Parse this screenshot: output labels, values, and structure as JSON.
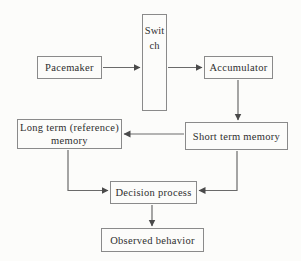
{
  "diagram": {
    "colors": {
      "background": "#fcfcfa",
      "box_border": "#8a8a8a",
      "arrow_line": "#6a6a6a",
      "text": "#2e2e2e"
    },
    "nodes": {
      "pacemaker": {
        "label": "Pacemaker"
      },
      "switch": {
        "label": "Switch",
        "orientation": "vertical-stacked-letters"
      },
      "accumulator": {
        "label": "Accumulator"
      },
      "long_term": {
        "label": "Long term (reference) memory"
      },
      "short_term": {
        "label": "Short term memory"
      },
      "decision": {
        "label": "Decision process"
      },
      "observed": {
        "label": "Observed behavior"
      }
    },
    "edges": [
      {
        "from": "pacemaker",
        "to": "switch",
        "shape": "straight-right"
      },
      {
        "from": "switch",
        "to": "accumulator",
        "shape": "straight-right"
      },
      {
        "from": "accumulator",
        "to": "short_term",
        "shape": "straight-down"
      },
      {
        "from": "short_term",
        "to": "long_term",
        "shape": "straight-left"
      },
      {
        "from": "long_term",
        "to": "decision",
        "shape": "elbow-down-right"
      },
      {
        "from": "short_term",
        "to": "decision",
        "shape": "elbow-down-left"
      },
      {
        "from": "decision",
        "to": "observed",
        "shape": "straight-down"
      }
    ]
  }
}
